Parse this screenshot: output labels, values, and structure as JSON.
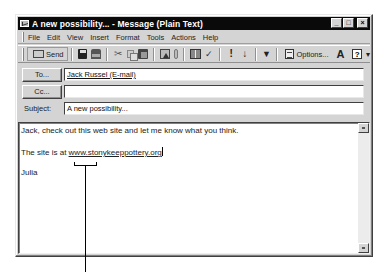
{
  "window": {
    "title": "A new possibility... - Message (Plain Text)",
    "controls": {
      "minimize": "_",
      "maximize": "□",
      "close": "×"
    }
  },
  "menubar": {
    "items": [
      {
        "label": "File",
        "accel": "F"
      },
      {
        "label": "Edit",
        "accel": "E"
      },
      {
        "label": "View",
        "accel": "V"
      },
      {
        "label": "Insert",
        "accel": "I"
      },
      {
        "label": "Format",
        "accel": "o"
      },
      {
        "label": "Tools",
        "accel": "T"
      },
      {
        "label": "Actions",
        "accel": "A"
      },
      {
        "label": "Help",
        "accel": "H"
      }
    ]
  },
  "toolbar": {
    "send_label": "Send",
    "options_label": "Options...",
    "icons": [
      "send-icon",
      "save-icon",
      "print-icon",
      "cut-icon",
      "copy-icon",
      "paste-icon",
      "address-book-icon",
      "attach-icon",
      "address-book-icon",
      "check-names-icon",
      "high-importance-icon",
      "low-importance-icon",
      "flag-icon",
      "options-icon",
      "font-icon",
      "help-icon"
    ],
    "cut_glyph": "✂",
    "check_glyph": "✓",
    "importance_high_glyph": "!",
    "importance_low_glyph": "↓",
    "flag_glyph": "▼",
    "font_glyph": "A",
    "help_glyph": "?",
    "more_glyph": "▾"
  },
  "headers": {
    "to_label": "To...",
    "to_value": "Jack Russel (E-mail)",
    "cc_label": "Cc...",
    "cc_value": "",
    "subject_label": "Subject:",
    "subject_value": "A new possibility..."
  },
  "body": {
    "line1": "Jack, check out this web site and let me know what you think.",
    "line2_prefix": "The site is at ",
    "line2_url": "www.stonykeeppottery.org",
    "signature": "Julia"
  }
}
